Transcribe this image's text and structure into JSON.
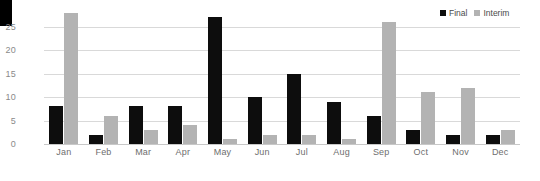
{
  "chart_data": {
    "type": "bar",
    "title": "",
    "xlabel": "",
    "ylabel": "",
    "categories": [
      "Jan",
      "Feb",
      "Mar",
      "Apr",
      "May",
      "Jun",
      "Jul",
      "Aug",
      "Sep",
      "Oct",
      "Nov",
      "Dec"
    ],
    "series": [
      {
        "name": "Final",
        "color": "#0d0d0d",
        "values": [
          8,
          2,
          8,
          8,
          27,
          10,
          15,
          9,
          6,
          3,
          2,
          2
        ]
      },
      {
        "name": "Interim",
        "color": "#b3b3b3",
        "values": [
          28,
          6,
          3,
          4,
          1,
          2,
          2,
          1,
          26,
          11,
          12,
          3
        ]
      }
    ],
    "ylim": [
      0,
      29
    ],
    "yticks": [
      0,
      5,
      10,
      15,
      20,
      25
    ],
    "ytick_labels": [
      "0",
      "5",
      "10",
      "15",
      "20",
      "25"
    ],
    "grid": true,
    "legend_position": "top-right"
  },
  "legend": {
    "items": [
      {
        "label": "Final",
        "swatch": "final-swatch"
      },
      {
        "label": "Interim",
        "swatch": "interim-swatch"
      }
    ]
  },
  "colors": {
    "final": "#0d0d0d",
    "interim": "#b3b3b3",
    "gridline": "#d9d9d9",
    "axis_text": "#8a8a8a",
    "background": "#ffffff"
  }
}
